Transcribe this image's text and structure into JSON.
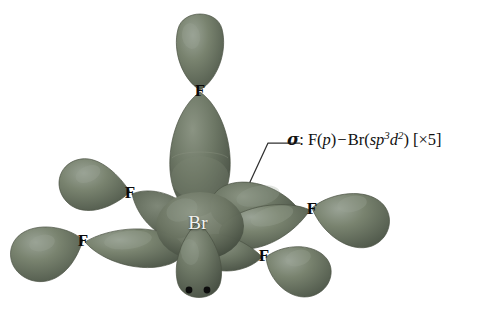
{
  "figure": {
    "kind": "orbital-overlap-diagram",
    "molecule": "BrF5",
    "geometry": "square pyramidal",
    "background_color": "#ffffff",
    "orbital_color": "#6f7a6a",
    "orbital_color_light": "#8d968a",
    "orbital_color_dark": "#4e574b",
    "label_color": "#0a0a0a",
    "center_label_color": "#f2f2ef",
    "leader_color": "#303030"
  },
  "center_atom": {
    "label": "Br",
    "x": 198,
    "y": 222
  },
  "terminal_atoms": [
    {
      "label": "F",
      "x": 200,
      "y": 90,
      "position": "axial-top"
    },
    {
      "label": "F",
      "x": 130,
      "y": 192,
      "position": "equatorial-upper-left"
    },
    {
      "label": "F",
      "x": 83,
      "y": 240,
      "position": "equatorial-far-left"
    },
    {
      "label": "F",
      "x": 312,
      "y": 208,
      "position": "equatorial-right"
    },
    {
      "label": "F",
      "x": 264,
      "y": 255,
      "position": "equatorial-lower-right"
    }
  ],
  "lone_pair": {
    "dots": 2,
    "dot_positions": [
      {
        "x": 189,
        "y": 290
      },
      {
        "x": 207,
        "y": 290
      }
    ],
    "lobe_direction": "down"
  },
  "annotation": {
    "leader_line": {
      "from_x": 250,
      "from_y": 182,
      "bend_x": 268,
      "bend_y": 143,
      "to_x": 300,
      "to_y": 143
    },
    "sigma": "σ",
    "colon": ": ",
    "left_atom": "F(",
    "left_orbital": "p",
    "left_close": ")",
    "minus": "−",
    "right_atom": "Br(",
    "right_orbital_sp": "sp",
    "right_orbital_sp_sup": "3",
    "right_orbital_d": "d",
    "right_orbital_d_sup": "2",
    "right_close": ")",
    "multiplicity": "[×5]",
    "full_text": "σ: F(p) − Br(sp3d2) [×5]"
  }
}
